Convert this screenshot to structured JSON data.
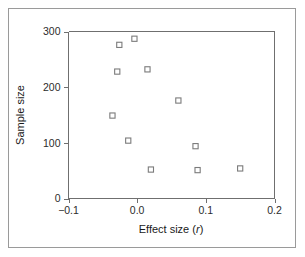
{
  "figure": {
    "border_color": "#9a9a9a",
    "background": "#ffffff",
    "axis_color": "#6f6f6f",
    "marker_color": "#7b7b7b"
  },
  "chart_data": {
    "type": "scatter",
    "title": "",
    "xlabel": "Effect size (r)",
    "xlabel_plain": "Effect size (",
    "xlabel_italic": "r",
    "xlabel_close": ")",
    "ylabel": "Sample size",
    "xlim": [
      -0.1,
      0.2
    ],
    "ylim": [
      0,
      300
    ],
    "xticks": [
      -0.1,
      0.0,
      0.1,
      0.2
    ],
    "xticklabels": [
      "−0.1",
      "0.0",
      "0.1",
      "0.2"
    ],
    "yticks": [
      0,
      100,
      200,
      300
    ],
    "yticklabels": [
      "0",
      "100",
      "200",
      "300"
    ],
    "grid": false,
    "legend": false,
    "marker": "open-square",
    "x": [
      -0.026,
      -0.004,
      -0.029,
      0.015,
      -0.036,
      -0.013,
      0.06,
      0.085,
      0.02,
      0.088,
      0.15
    ],
    "y": [
      276,
      287,
      228,
      232,
      149,
      104,
      176,
      94,
      52,
      51,
      54
    ],
    "points": [
      {
        "x": -0.026,
        "y": 276
      },
      {
        "x": -0.004,
        "y": 287
      },
      {
        "x": -0.029,
        "y": 228
      },
      {
        "x": 0.015,
        "y": 232
      },
      {
        "x": -0.036,
        "y": 149
      },
      {
        "x": -0.013,
        "y": 104
      },
      {
        "x": 0.06,
        "y": 176
      },
      {
        "x": 0.085,
        "y": 94
      },
      {
        "x": 0.02,
        "y": 52
      },
      {
        "x": 0.088,
        "y": 51
      },
      {
        "x": 0.15,
        "y": 54
      }
    ]
  }
}
